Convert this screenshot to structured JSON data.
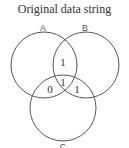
{
  "title": "Original data string",
  "sets": [
    {
      "label": "A",
      "cx": 44,
      "cy": 65,
      "r": 33,
      "lx": 43,
      "ly": 31
    },
    {
      "label": "B",
      "cx": 86,
      "cy": 65,
      "r": 33,
      "lx": 85,
      "ly": 31
    },
    {
      "label": "C",
      "cx": 63,
      "cy": 108,
      "r": 33,
      "lx": 63,
      "ly": 150
    }
  ],
  "regions": [
    {
      "name": "A∩B",
      "value": "1",
      "x": 63,
      "y": 66
    },
    {
      "name": "A∩B∩C",
      "value": "1",
      "x": 63,
      "y": 86
    },
    {
      "name": "A∩C",
      "value": "0",
      "x": 50,
      "y": 93
    },
    {
      "name": "B∩C",
      "value": "1",
      "x": 77,
      "y": 93
    }
  ]
}
